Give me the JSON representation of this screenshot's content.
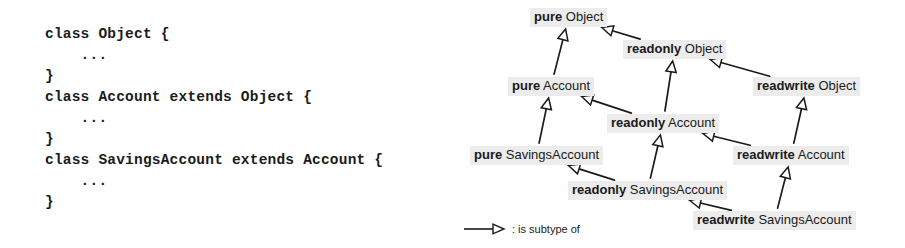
{
  "code": {
    "lines": [
      "class Object {",
      "    ...",
      "}",
      "class Account extends Object {",
      "    ...",
      "}",
      "class SavingsAccount extends Account {",
      "    ...",
      "}"
    ]
  },
  "diagram": {
    "title": "",
    "node_bg_color": "#ececec",
    "text_color": "#1a1a1a",
    "arrow_color": "#1a1a1a",
    "nodes": [
      {
        "id": "pure-object",
        "modifier": "pure",
        "class_name": "Object",
        "x": 75,
        "y": 8
      },
      {
        "id": "readonly-object",
        "modifier": "readonly",
        "class_name": "Object",
        "x": 168,
        "y": 40
      },
      {
        "id": "readwrite-object",
        "modifier": "readwrite",
        "class_name": "Object",
        "x": 298,
        "y": 77
      },
      {
        "id": "pure-account",
        "modifier": "pure",
        "class_name": "Account",
        "x": 53,
        "y": 77
      },
      {
        "id": "readonly-account",
        "modifier": "readonly",
        "class_name": "Account",
        "x": 152,
        "y": 114
      },
      {
        "id": "readwrite-account",
        "modifier": "readwrite",
        "class_name": "Account",
        "x": 278,
        "y": 146
      },
      {
        "id": "pure-savingsaccount",
        "modifier": "pure",
        "class_name": "SavingsAccount",
        "x": 15,
        "y": 146
      },
      {
        "id": "readonly-savingsaccount",
        "modifier": "readonly",
        "class_name": "SavingsAccount",
        "x": 113,
        "y": 181
      },
      {
        "id": "readwrite-savingsaccount",
        "modifier": "readwrite",
        "class_name": "SavingsAccount",
        "x": 238,
        "y": 211
      }
    ],
    "edges": [
      {
        "from": "readonly-object",
        "to": "pure-object"
      },
      {
        "from": "readwrite-object",
        "to": "readonly-object"
      },
      {
        "from": "pure-account",
        "to": "pure-object"
      },
      {
        "from": "readonly-account",
        "to": "pure-account"
      },
      {
        "from": "readonly-account",
        "to": "readonly-object"
      },
      {
        "from": "readwrite-account",
        "to": "readwrite-object"
      },
      {
        "from": "readwrite-account",
        "to": "readonly-account"
      },
      {
        "from": "pure-savingsaccount",
        "to": "pure-account"
      },
      {
        "from": "readonly-savingsaccount",
        "to": "pure-savingsaccount"
      },
      {
        "from": "readonly-savingsaccount",
        "to": "readonly-account"
      },
      {
        "from": "readwrite-savingsaccount",
        "to": "readonly-savingsaccount"
      },
      {
        "from": "readwrite-savingsaccount",
        "to": "readwrite-account"
      }
    ],
    "legend": {
      "symbol": "open-triangle-arrow",
      "label": ": is subtype of"
    }
  }
}
